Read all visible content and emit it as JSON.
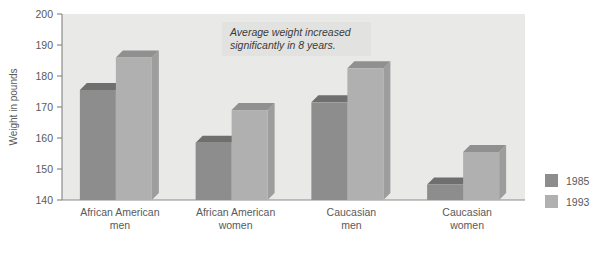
{
  "chart_data": {
    "type": "bar",
    "title": "",
    "xlabel": "",
    "ylabel": "Weight in pounds",
    "ylim": [
      140,
      200
    ],
    "yticks": [
      140,
      150,
      160,
      170,
      180,
      190,
      200
    ],
    "ytick_labels": [
      "140",
      "150",
      "160",
      "170",
      "180",
      "190",
      "200"
    ],
    "grid": false,
    "legend_position": "right",
    "categories": [
      "African American men",
      "African American women",
      "Caucasian men",
      "Caucasian women"
    ],
    "category_lines": [
      [
        "African American",
        "men"
      ],
      [
        "African American",
        "women"
      ],
      [
        "Caucasian",
        "men"
      ],
      [
        "Caucasian",
        "women"
      ]
    ],
    "series": [
      {
        "name": "1985",
        "color": "#8d8d8d",
        "values": [
          175.5,
          158.5,
          171.5,
          145.0
        ]
      },
      {
        "name": "1993",
        "color": "#b0b0b0",
        "values": [
          186.0,
          169.0,
          182.5,
          155.5
        ]
      }
    ],
    "annotations": [
      {
        "lines": [
          "Average weight increased",
          "significantly in 8 years."
        ],
        "style": "italic"
      }
    ]
  },
  "axis": {
    "y_title": "Weight in pounds"
  },
  "legend": {
    "items": [
      {
        "label": "1985",
        "color": "#8d8d8d"
      },
      {
        "label": "1993",
        "color": "#b0b0b0"
      }
    ]
  },
  "colors": {
    "plot_background": "#e9e9e7",
    "axis_line": "#8c8c8c",
    "text": "#58595b",
    "series_1985": "#8d8d8d",
    "series_1993": "#b0b0b0",
    "series_1985_top": "#6f6f6f",
    "series_1985_side": "#7c7c7c",
    "series_1993_top": "#909090",
    "series_1993_side": "#9d9d9d",
    "annotation_background": "#e2e2e0",
    "page_background": "#ffffff"
  },
  "caption": {
    "fragment": ""
  }
}
